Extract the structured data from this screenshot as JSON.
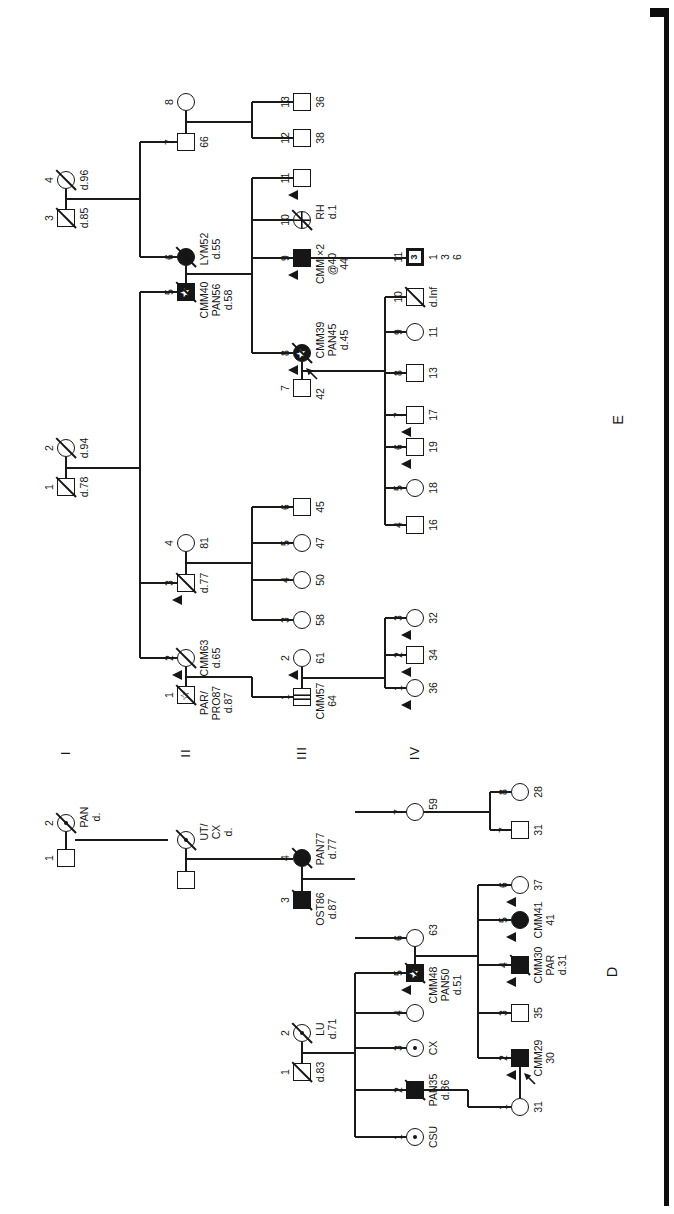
{
  "figure_labels": {
    "d": "D",
    "e": "E"
  },
  "generation_labels": [
    "I",
    "II",
    "III",
    "IV"
  ],
  "icons": {
    "star_filled": "★",
    "star_open": "☆",
    "triangle": "dysplastic-nevi-triangle",
    "slash": "deceased-slash",
    "arrow": "proband-arrow"
  },
  "persons": [
    {
      "p": "E",
      "gen": "I",
      "n": "1",
      "sex": "M",
      "x": 727,
      "y": 66,
      "fill": "open",
      "dec": true,
      "lab": [
        "d.78"
      ]
    },
    {
      "p": "E",
      "gen": "I",
      "n": "2",
      "sex": "F",
      "x": 766,
      "y": 66,
      "fill": "open",
      "dec": true,
      "lab": [
        "d.94"
      ]
    },
    {
      "p": "E",
      "gen": "I",
      "n": "3",
      "sex": "M",
      "x": 996,
      "y": 66,
      "fill": "open",
      "dec": true,
      "lab": [
        "d.85"
      ]
    },
    {
      "p": "E",
      "gen": "I",
      "n": "4",
      "sex": "F",
      "x": 1034,
      "y": 66,
      "fill": "open",
      "dec": true,
      "lab": [
        "d.96"
      ]
    },
    {
      "p": "E",
      "gen": "II",
      "n": "1",
      "sex": "M",
      "x": 519,
      "y": 186,
      "fill": "star-open",
      "dec": true,
      "dx": -8,
      "lab": [
        "PAR/",
        "PRO87",
        "d.87"
      ]
    },
    {
      "p": "E",
      "gen": "II",
      "n": "2",
      "sex": "F",
      "x": 556,
      "y": 186,
      "fill": "open",
      "dec": true,
      "tri": true,
      "lab": [
        "CMM63",
        "d.65"
      ]
    },
    {
      "p": "E",
      "gen": "II",
      "n": "3",
      "sex": "M",
      "x": 631,
      "y": 186,
      "fill": "open",
      "dec": true,
      "tri": true,
      "lab": [
        "d.77"
      ]
    },
    {
      "p": "E",
      "gen": "II",
      "n": "4",
      "sex": "F",
      "x": 671,
      "y": 186,
      "fill": "open",
      "lab": [
        "81"
      ]
    },
    {
      "p": "E",
      "gen": "II",
      "n": "5",
      "sex": "M",
      "x": 922,
      "y": 186,
      "fill": "star-filled",
      "dec": true,
      "dx": -8,
      "lab": [
        "CMM40",
        "PAN56",
        "d.58"
      ]
    },
    {
      "p": "E",
      "gen": "II",
      "n": "6",
      "sex": "F",
      "x": 957,
      "y": 186,
      "fill": "filled",
      "dec": true,
      "dx": 8,
      "lab": [
        "LYM52",
        "d.55"
      ]
    },
    {
      "p": "E",
      "gen": "II",
      "n": "7",
      "sex": "M",
      "x": 1072,
      "y": 186,
      "fill": "open",
      "lab": [
        "66"
      ]
    },
    {
      "p": "E",
      "gen": "II",
      "n": "8",
      "sex": "F",
      "x": 1112,
      "y": 186,
      "fill": "open",
      "lab": []
    },
    {
      "p": "E",
      "gen": "III",
      "n": "1",
      "sex": "M",
      "x": 517,
      "y": 302,
      "fill": "striped",
      "dx": -4,
      "lab": [
        "CMM57",
        "64"
      ]
    },
    {
      "p": "E",
      "gen": "III",
      "n": "2",
      "sex": "F",
      "x": 556,
      "y": 302,
      "fill": "open",
      "tri": true,
      "lab": [
        "61"
      ]
    },
    {
      "p": "E",
      "gen": "III",
      "n": "3",
      "sex": "F",
      "x": 594,
      "y": 302,
      "fill": "open",
      "lab": [
        "58"
      ]
    },
    {
      "p": "E",
      "gen": "III",
      "n": "4",
      "sex": "F",
      "x": 634,
      "y": 302,
      "fill": "open",
      "lab": [
        "50"
      ]
    },
    {
      "p": "E",
      "gen": "III",
      "n": "5",
      "sex": "F",
      "x": 671,
      "y": 302,
      "fill": "open",
      "lab": [
        "47"
      ]
    },
    {
      "p": "E",
      "gen": "III",
      "n": "6",
      "sex": "M",
      "x": 707,
      "y": 302,
      "fill": "open",
      "lab": [
        "45"
      ]
    },
    {
      "p": "E",
      "gen": "III",
      "n": "7",
      "sex": "M",
      "x": 826,
      "y": 302,
      "fill": "open",
      "dx": -6,
      "lab": [
        "42"
      ]
    },
    {
      "p": "E",
      "gen": "III",
      "n": "8",
      "sex": "F",
      "x": 861,
      "y": 302,
      "fill": "star-filled",
      "dec": true,
      "tri": true,
      "arrow": true,
      "dx": 13,
      "lab": [
        "CMM39",
        "PAN45",
        "d.45"
      ]
    },
    {
      "p": "E",
      "gen": "III",
      "n": "9",
      "sex": "M",
      "x": 956,
      "y": 302,
      "fill": "filled",
      "tri": true,
      "dx": -6,
      "lab": [
        "CMM ×2",
        "@40",
        "44"
      ]
    },
    {
      "p": "E",
      "gen": "III",
      "n": "10",
      "sex": "F",
      "x": 994,
      "y": 302,
      "fill": "cross",
      "dec": true,
      "dx": 8,
      "lab": [
        "RH",
        "d.1"
      ]
    },
    {
      "p": "E",
      "gen": "III",
      "n": "11",
      "sex": "M",
      "x": 1036,
      "y": 302,
      "fill": "open",
      "tri": true,
      "lab": []
    },
    {
      "p": "E",
      "gen": "III",
      "n": "12",
      "sex": "M",
      "x": 1076,
      "y": 302,
      "fill": "open",
      "lab": [
        "38"
      ]
    },
    {
      "p": "E",
      "gen": "III",
      "n": "13",
      "sex": "M",
      "x": 1112,
      "y": 302,
      "fill": "open",
      "lab": [
        "36"
      ]
    },
    {
      "p": "E",
      "gen": "IV",
      "n": "1",
      "sex": "F",
      "x": 526,
      "y": 415,
      "fill": "open",
      "tri": true,
      "lab": [
        "36"
      ]
    },
    {
      "p": "E",
      "gen": "IV",
      "n": "2",
      "sex": "M",
      "x": 559,
      "y": 415,
      "fill": "open",
      "tri": true,
      "lab": [
        "34"
      ]
    },
    {
      "p": "E",
      "gen": "IV",
      "n": "3",
      "sex": "F",
      "x": 596,
      "y": 415,
      "fill": "open",
      "tri": true,
      "lab": [
        "32"
      ]
    },
    {
      "p": "E",
      "gen": "IV",
      "n": "4",
      "sex": "M",
      "x": 689,
      "y": 415,
      "fill": "open",
      "lab": [
        "16"
      ]
    },
    {
      "p": "E",
      "gen": "IV",
      "n": "5",
      "sex": "F",
      "x": 726,
      "y": 415,
      "fill": "open",
      "lab": [
        "18"
      ]
    },
    {
      "p": "E",
      "gen": "IV",
      "n": "6",
      "sex": "M",
      "x": 767,
      "y": 415,
      "fill": "open",
      "tri": true,
      "lab": [
        "19"
      ]
    },
    {
      "p": "E",
      "gen": "IV",
      "n": "7",
      "sex": "M",
      "x": 799,
      "y": 415,
      "fill": "open",
      "tri": true,
      "lab": [
        "17"
      ]
    },
    {
      "p": "E",
      "gen": "IV",
      "n": "8",
      "sex": "M",
      "x": 841,
      "y": 415,
      "fill": "open",
      "lab": [
        "13"
      ]
    },
    {
      "p": "E",
      "gen": "IV",
      "n": "9",
      "sex": "F",
      "x": 882,
      "y": 415,
      "fill": "open",
      "lab": [
        "11"
      ]
    },
    {
      "p": "E",
      "gen": "IV",
      "n": "10",
      "sex": "M",
      "x": 917,
      "y": 415,
      "fill": "open",
      "dec": true,
      "lab": [
        "d.Inf"
      ]
    },
    {
      "p": "E",
      "gen": "IV",
      "n": "11",
      "sex": "M",
      "x": 957,
      "y": 415,
      "fill": "multi",
      "inner": "3",
      "lab": [
        "1",
        "3",
        "6"
      ]
    },
    {
      "p": "D",
      "gen": "I",
      "n": "1",
      "sex": "M",
      "x": 356,
      "y": 66,
      "fill": "open",
      "lab": []
    },
    {
      "p": "D",
      "gen": "I",
      "n": "2",
      "sex": "F",
      "x": 391,
      "y": 66,
      "fill": "open",
      "dec": true,
      "dot": true,
      "dx": 6,
      "lab": [
        "PAN",
        "d."
      ]
    },
    {
      "p": "D",
      "gen": "II",
      "n": "",
      "sex": "M",
      "x": 334,
      "y": 186,
      "fill": "open",
      "lab": []
    },
    {
      "p": "D",
      "gen": "II",
      "n": "",
      "sex": "F",
      "x": 374,
      "y": 186,
      "fill": "open",
      "dec": true,
      "dot": true,
      "dx": 8,
      "lab": [
        "UT/",
        "CX",
        "d."
      ]
    },
    {
      "p": "D",
      "gen": "III",
      "n": "1",
      "sex": "M",
      "x": 142,
      "y": 302,
      "fill": "open",
      "dec": true,
      "lab": [
        "d.83"
      ]
    },
    {
      "p": "D",
      "gen": "III",
      "n": "2",
      "sex": "F",
      "x": 181,
      "y": 302,
      "fill": "open",
      "dec": true,
      "dot": true,
      "dx": 4,
      "lab": [
        "LU",
        "d.71"
      ]
    },
    {
      "p": "D",
      "gen": "III",
      "n": "3",
      "sex": "M",
      "x": 314,
      "y": 302,
      "fill": "filled",
      "dec": true,
      "dx": -9,
      "lab": [
        "OST86",
        "d.87"
      ]
    },
    {
      "p": "D",
      "gen": "III",
      "n": "4",
      "sex": "F",
      "x": 356,
      "y": 302,
      "fill": "filled",
      "dec": true,
      "dx": 9,
      "lab": [
        "PAN77",
        "d.77"
      ]
    },
    {
      "p": "D",
      "gen": "IV",
      "n": "1",
      "sex": "F",
      "x": 77,
      "y": 415,
      "fill": "open",
      "dot": true,
      "lab": [
        "CSU"
      ]
    },
    {
      "p": "D",
      "gen": "IV",
      "n": "2",
      "sex": "M",
      "x": 124,
      "y": 415,
      "fill": "filled",
      "dec": true,
      "lab": [
        "PAN35",
        "d.36"
      ]
    },
    {
      "p": "D",
      "gen": "IV",
      "n": "3",
      "sex": "F",
      "x": 166,
      "y": 415,
      "fill": "open",
      "dot": true,
      "lab": [
        "CX"
      ]
    },
    {
      "p": "D",
      "gen": "IV",
      "n": "4",
      "sex": "F",
      "x": 201,
      "y": 415,
      "fill": "open",
      "lab": []
    },
    {
      "p": "D",
      "gen": "IV",
      "n": "5",
      "sex": "M",
      "x": 241,
      "y": 415,
      "fill": "star-filled",
      "dec": true,
      "tri": true,
      "dx": -12,
      "lab": [
        "CMM48",
        "PAN50",
        "d.51"
      ]
    },
    {
      "p": "D",
      "gen": "IV",
      "n": "6",
      "sex": "F",
      "x": 276,
      "y": 415,
      "fill": "open",
      "dx": 8,
      "lab": [
        "63"
      ]
    },
    {
      "p": "D",
      "gen": "IV",
      "n": "7",
      "sex": "F",
      "x": 402,
      "y": 415,
      "fill": "open",
      "dx": 8,
      "lab": [
        "59"
      ]
    },
    {
      "p": "D",
      "gen": "V",
      "n": "1",
      "sex": "F",
      "x": 107,
      "y": 520,
      "fill": "open",
      "lab": [
        "31"
      ]
    },
    {
      "p": "D",
      "gen": "V",
      "n": "2",
      "sex": "M",
      "x": 156,
      "y": 520,
      "fill": "filled",
      "tri": true,
      "arrow": true,
      "lab": [
        "CMM29",
        "30"
      ]
    },
    {
      "p": "D",
      "gen": "V",
      "n": "3",
      "sex": "M",
      "x": 201,
      "y": 520,
      "fill": "open",
      "lab": [
        "35"
      ]
    },
    {
      "p": "D",
      "gen": "V",
      "n": "4",
      "sex": "M",
      "x": 249,
      "y": 520,
      "fill": "filled",
      "dec": true,
      "tri": true,
      "lab": [
        "CMM30",
        "PAR",
        "d.31"
      ]
    },
    {
      "p": "D",
      "gen": "V",
      "n": "5",
      "sex": "F",
      "x": 294,
      "y": 520,
      "fill": "filled",
      "tri": true,
      "lab": [
        "CMM41",
        "41"
      ]
    },
    {
      "p": "D",
      "gen": "V",
      "n": "6",
      "sex": "F",
      "x": 329,
      "y": 520,
      "fill": "open",
      "tri": true,
      "lab": [
        "37"
      ]
    },
    {
      "p": "D",
      "gen": "V",
      "n": "7",
      "sex": "M",
      "x": 384,
      "y": 520,
      "fill": "open",
      "lab": [
        "31"
      ]
    },
    {
      "p": "D",
      "gen": "V",
      "n": "8",
      "sex": "F",
      "x": 422,
      "y": 520,
      "fill": "open",
      "lab": [
        "28"
      ]
    }
  ],
  "segments": [
    [
      736,
      66,
      757,
      66
    ],
    [
      1005,
      66,
      1025,
      66
    ],
    [
      528,
      186,
      547,
      186
    ],
    [
      640,
      186,
      662,
      186
    ],
    [
      931,
      186,
      948,
      186
    ],
    [
      1081,
      186,
      1103,
      186
    ],
    [
      526,
      302,
      547,
      302
    ],
    [
      835,
      302,
      852,
      302
    ],
    [
      746,
      66,
      746,
      140
    ],
    [
      556,
      140,
      922,
      140
    ],
    [
      556,
      140,
      556,
      177
    ],
    [
      631,
      140,
      631,
      177
    ],
    [
      922,
      140,
      922,
      177
    ],
    [
      1015,
      66,
      1015,
      140
    ],
    [
      957,
      140,
      1072,
      140
    ],
    [
      957,
      140,
      957,
      177
    ],
    [
      1072,
      140,
      1072,
      177
    ],
    [
      537,
      186,
      537,
      252
    ],
    [
      517,
      252,
      537,
      252
    ],
    [
      517,
      252,
      517,
      293
    ],
    [
      651,
      186,
      651,
      252
    ],
    [
      594,
      252,
      707,
      252
    ],
    [
      594,
      252,
      594,
      293
    ],
    [
      634,
      252,
      634,
      293
    ],
    [
      671,
      252,
      671,
      293
    ],
    [
      707,
      252,
      707,
      293
    ],
    [
      940,
      186,
      940,
      252
    ],
    [
      861,
      252,
      1036,
      252
    ],
    [
      861,
      252,
      861,
      293
    ],
    [
      956,
      252,
      956,
      293
    ],
    [
      994,
      252,
      994,
      293
    ],
    [
      1036,
      252,
      1036,
      293
    ],
    [
      1092,
      186,
      1092,
      252
    ],
    [
      1076,
      252,
      1112,
      252
    ],
    [
      1076,
      252,
      1076,
      293
    ],
    [
      1112,
      252,
      1112,
      293
    ],
    [
      536,
      302,
      536,
      385
    ],
    [
      526,
      385,
      596,
      385
    ],
    [
      526,
      385,
      526,
      406
    ],
    [
      559,
      385,
      559,
      406
    ],
    [
      596,
      385,
      596,
      406
    ],
    [
      843,
      302,
      843,
      385
    ],
    [
      689,
      385,
      917,
      385
    ],
    [
      689,
      385,
      689,
      406
    ],
    [
      726,
      385,
      726,
      406
    ],
    [
      767,
      385,
      767,
      406
    ],
    [
      799,
      385,
      799,
      406
    ],
    [
      841,
      385,
      841,
      406
    ],
    [
      882,
      385,
      882,
      406
    ],
    [
      917,
      385,
      917,
      406
    ],
    [
      956,
      311,
      956,
      406
    ],
    [
      365,
      66,
      382,
      66
    ],
    [
      343,
      186,
      365,
      186
    ],
    [
      151,
      302,
      172,
      302
    ],
    [
      323,
      302,
      347,
      302
    ],
    [
      250,
      415,
      267,
      415
    ],
    [
      116,
      520,
      147,
      520
    ],
    [
      374,
      75,
      374,
      168
    ],
    [
      355,
      186,
      355,
      293
    ],
    [
      161,
      302,
      161,
      355
    ],
    [
      77,
      355,
      241,
      355
    ],
    [
      77,
      355,
      77,
      406
    ],
    [
      124,
      355,
      124,
      406
    ],
    [
      166,
      355,
      166,
      406
    ],
    [
      201,
      355,
      201,
      406
    ],
    [
      241,
      355,
      241,
      406
    ],
    [
      335,
      302,
      335,
      355
    ],
    [
      276,
      355,
      276,
      406
    ],
    [
      402,
      355,
      402,
      406
    ],
    [
      258,
      415,
      258,
      478
    ],
    [
      156,
      478,
      329,
      478
    ],
    [
      156,
      478,
      156,
      511
    ],
    [
      201,
      478,
      201,
      511
    ],
    [
      249,
      478,
      249,
      511
    ],
    [
      294,
      478,
      294,
      511
    ],
    [
      329,
      478,
      329,
      511
    ],
    [
      402,
      424,
      402,
      490
    ],
    [
      384,
      490,
      422,
      490
    ],
    [
      384,
      490,
      384,
      511
    ],
    [
      422,
      490,
      422,
      511
    ],
    [
      124,
      424,
      124,
      468
    ],
    [
      107,
      468,
      124,
      468
    ],
    [
      107,
      468,
      107,
      511
    ]
  ]
}
